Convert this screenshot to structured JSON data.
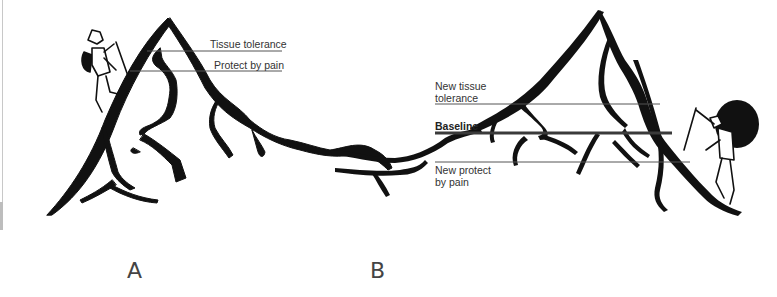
{
  "figure": {
    "panels": [
      {
        "id": "A",
        "label": "A",
        "annotations": [
          {
            "text": "Tissue tolerance",
            "line_y": 51
          },
          {
            "text": "Protect by pain",
            "line_y": 71
          }
        ]
      },
      {
        "id": "B",
        "label": "B",
        "annotations": [
          {
            "text_line1": "New tissue",
            "text_line2": "tolerance",
            "line_y": 104
          },
          {
            "text": "Baseline",
            "line_y": 133,
            "bold": true
          },
          {
            "text_line1": "New protect",
            "text_line2": "by pain",
            "line_y": 162
          }
        ]
      }
    ],
    "colors": {
      "ink": "#111111",
      "guide_line": "#555555",
      "baseline_line": "#3a3a3a",
      "text": "#333333"
    }
  }
}
